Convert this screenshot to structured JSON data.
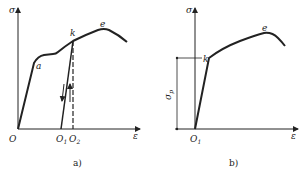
{
  "figure_a": {
    "y_axis_label": "σ",
    "x_axis_label": "ε",
    "origin_label": "O",
    "point_a_label": "a",
    "point_k_label": "k",
    "point_e_label": "e",
    "o1_label": "O",
    "o1_sub": "1",
    "o2_label": "O",
    "o2_sub": "2",
    "caption": "a)"
  },
  "figure_b": {
    "y_axis_label": "σ",
    "x_axis_label": "ε",
    "origin_label": "O",
    "origin_sub": "1",
    "point_k_label": "k",
    "point_e_label": "e",
    "sigma_p_label": "σ",
    "sigma_p_sub": "p",
    "caption": "b)"
  },
  "colors": {
    "ink": "#222222",
    "background": "#ffffff"
  }
}
